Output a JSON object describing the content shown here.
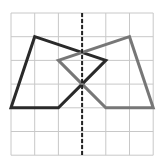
{
  "diagram": {
    "type": "grid-reflection",
    "grid": {
      "cols": 6,
      "rows": 6,
      "origin_px": [
        11,
        13
      ],
      "cell_px": 23.7,
      "line_color": "#c8c8c8"
    },
    "mirror_line": {
      "x": 3,
      "style": "dashed",
      "color": "#222222"
    },
    "shapes": [
      {
        "name": "original-shape",
        "color": "#2a2a2a",
        "points": [
          [
            1,
            1
          ],
          [
            4,
            2
          ],
          [
            3,
            3
          ],
          [
            2,
            4
          ],
          [
            0,
            4
          ]
        ]
      },
      {
        "name": "reflected-shape",
        "color": "#777777",
        "points": [
          [
            5,
            1
          ],
          [
            2,
            2
          ],
          [
            3,
            3
          ],
          [
            4,
            4
          ],
          [
            6,
            4
          ]
        ]
      }
    ]
  }
}
